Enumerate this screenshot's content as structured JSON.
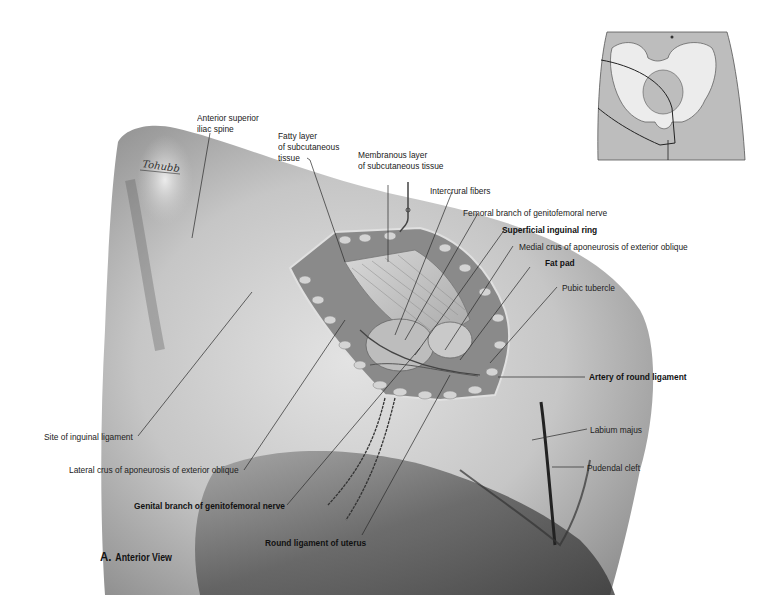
{
  "figure": {
    "caption_letter": "A.",
    "caption_text": "Anterior View",
    "signature": "Tohubb",
    "colors": {
      "background": "#ffffff",
      "skin_light": "#d9d9d9",
      "skin_mid": "#b5b5b5",
      "skin_dark": "#5a5a5a",
      "label_text": "#222222",
      "leader_line": "#333333",
      "inset_fill": "#bdbdbd",
      "inset_bone": "#ececec"
    }
  },
  "labels": [
    {
      "id": "asis",
      "lines": [
        "Anterior superior",
        "iliac spine"
      ],
      "bold": false
    },
    {
      "id": "fatty-layer",
      "lines": [
        "Fatty layer",
        "of subcutaneous",
        "tissue"
      ],
      "bold": false
    },
    {
      "id": "membranous-layer",
      "lines": [
        "Membranous layer",
        "of subcutaneous tissue"
      ],
      "bold": false
    },
    {
      "id": "intercrural-fibers",
      "lines": [
        "Intercrural fibers"
      ],
      "bold": false
    },
    {
      "id": "femoral-branch",
      "lines": [
        "Femoral branch of genitofemoral nerve"
      ],
      "bold": false
    },
    {
      "id": "superficial-inguinal-ring",
      "lines": [
        "Superficial inguinal ring"
      ],
      "bold": true
    },
    {
      "id": "medial-crus",
      "lines": [
        "Medial crus of aponeurosis of exterior oblique"
      ],
      "bold": false
    },
    {
      "id": "fat-pad",
      "lines": [
        "Fat pad"
      ],
      "bold": true
    },
    {
      "id": "pubic-tubercle",
      "lines": [
        "Pubic tubercle"
      ],
      "bold": false
    },
    {
      "id": "artery-round-ligament",
      "lines": [
        "Artery of round ligament"
      ],
      "bold": true
    },
    {
      "id": "labium-majus",
      "lines": [
        "Labium majus"
      ],
      "bold": false
    },
    {
      "id": "pudendal-cleft",
      "lines": [
        "Pudendal cleft"
      ],
      "bold": false
    },
    {
      "id": "site-inguinal-ligament",
      "lines": [
        "Site of inguinal ligament"
      ],
      "bold": false
    },
    {
      "id": "lateral-crus",
      "lines": [
        "Lateral crus of aponeurosis of exterior oblique"
      ],
      "bold": false
    },
    {
      "id": "genital-branch",
      "lines": [
        "Genital branch of genitofemoral nerve"
      ],
      "bold": true
    },
    {
      "id": "round-ligament",
      "lines": [
        "Round ligament of uterus"
      ],
      "bold": true
    }
  ],
  "inset": {
    "description": "Orientation diagram of pelvis with dissection region outlined",
    "marker": "navel"
  }
}
